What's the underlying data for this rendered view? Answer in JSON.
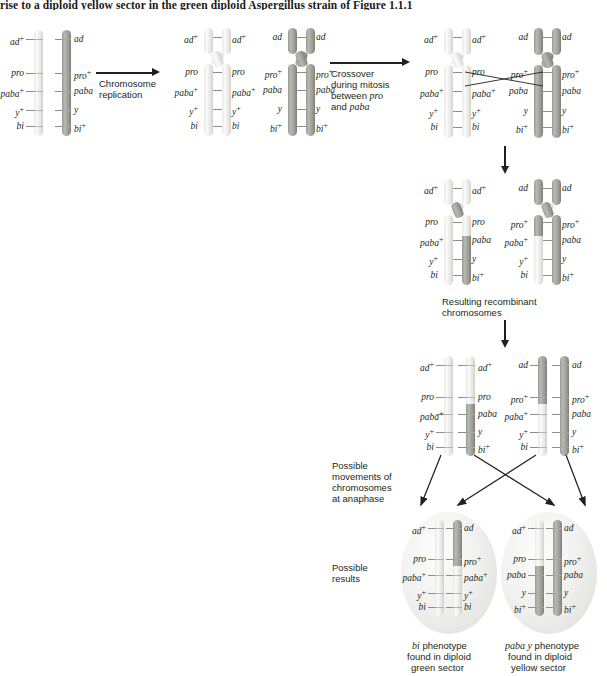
{
  "page": {
    "top_caption": "rise to a diploid yellow sector in the green diploid Aspergillus strain of Figure 1.1.1"
  },
  "markers": {
    "ad_plus": "ad+",
    "ad": "ad",
    "pro_plus": "pro+",
    "pro": "pro",
    "paba_plus": "paba+",
    "paba": "paba",
    "y_plus": "y+",
    "y": "y",
    "bi_plus": "bi+",
    "bi": "bi"
  },
  "steps": {
    "replication_label": "Chromosome\nreplication",
    "replication_line1": "Chromosome",
    "replication_line2": "replication",
    "crossover_line1": "Crossover",
    "crossover_line2": "during mitosis",
    "crossover_line3": "between pro",
    "crossover_line3a": "between ",
    "crossover_line3b": "pro",
    "crossover_line4a": "and ",
    "crossover_line4b": "paba",
    "recombinant_line1": "Resulting recombinant",
    "recombinant_line2": "chromosomes",
    "anaphase_line1": "Possible",
    "anaphase_line2": "movements of",
    "anaphase_line3": "chromosomes",
    "anaphase_line4": "at anaphase",
    "results_line1": "Possible",
    "results_line2": "results"
  },
  "outcomes": {
    "left": {
      "phenotype_italic": "bi",
      "phenotype_rest": " phenotype",
      "line2": "found in diploid",
      "line3": "green sector",
      "alleles_left": [
        "ad+",
        "pro",
        "paba+",
        "y+",
        "bi"
      ],
      "alleles_right": [
        "ad",
        "pro+",
        "paba+",
        "y+",
        "bi"
      ]
    },
    "right": {
      "phenotype_italic": "paba y",
      "phenotype_rest": " phenotype",
      "line2": "found in diploid",
      "line3": "yellow sector",
      "alleles_left": [
        "ad+",
        "pro",
        "paba",
        "y",
        "bi+"
      ],
      "alleles_right": [
        "ad",
        "pro+",
        "paba",
        "y",
        "bi+"
      ]
    }
  },
  "stage1": {
    "left_chrom_alleles": [
      "ad+",
      "pro",
      "paba+",
      "y+",
      "bi"
    ],
    "right_chrom_alleles": [
      "ad",
      "pro+",
      "paba",
      "y",
      "bi+"
    ]
  },
  "stage2": {
    "pairA_alleles": [
      "ad+",
      "pro",
      "paba+",
      "y+",
      "bi"
    ],
    "pairB_alleles": [
      "ad",
      "pro+",
      "paba",
      "y",
      "bi+"
    ]
  },
  "stage3": {
    "pairA_alleles": [
      "ad+",
      "pro",
      "paba+",
      "y+",
      "bi"
    ],
    "pairB_alleles": [
      "ad",
      "pro+",
      "paba",
      "y",
      "bi+"
    ]
  },
  "stage4": {
    "pairA_left": [
      "ad+",
      "pro",
      "paba+",
      "y+",
      "bi"
    ],
    "pairA_right": [
      "ad+",
      "pro",
      "paba",
      "y",
      "bi+"
    ],
    "pairB_left": [
      "ad",
      "pro+",
      "paba+",
      "y+",
      "bi"
    ],
    "pairB_right": [
      "ad",
      "pro+",
      "paba",
      "y",
      "bi+"
    ]
  },
  "stage5": {
    "pairA_left": [
      "ad+",
      "pro",
      "paba+",
      "y+",
      "bi"
    ],
    "pairA_right": [
      "ad+",
      "pro",
      "paba",
      "y",
      "bi+"
    ],
    "pairB_left": [
      "ad",
      "pro+",
      "paba+",
      "y+",
      "bi"
    ],
    "pairB_right": [
      "ad",
      "pro+",
      "paba",
      "y",
      "bi+"
    ]
  },
  "colors": {
    "light_chromosome": "#ebebe8",
    "dark_chromosome": "#9a9a95",
    "oval_fill": "#eeeeec",
    "text": "#231f20",
    "arrow": "#231f20"
  }
}
